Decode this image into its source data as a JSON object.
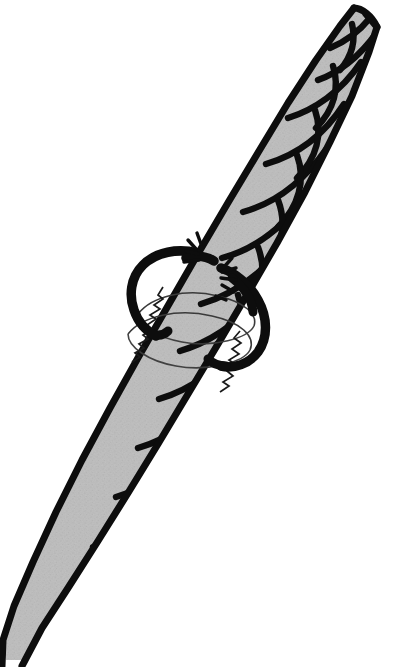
{
  "figure": {
    "title": "Twisted rope with whipping loop",
    "domain": "line-drawing",
    "canvas": {
      "width": 398,
      "height": 667
    },
    "background_color": "#ffffff",
    "ink_color": "#0d0d0d",
    "strand_fill_color": "#b3b3b3",
    "strand_fill_color_dark": "#a2a2a2",
    "thin_line_color": "#4a4a4a",
    "subject": "rope",
    "elements": [
      {
        "name": "rope-body",
        "label": "Twisted rope",
        "interactable": false
      },
      {
        "name": "rope-strand-divider",
        "label": "Strand seam lines",
        "interactable": false
      },
      {
        "name": "whipping-loop-upper-left",
        "label": "Upper-left heavy loop",
        "interactable": false
      },
      {
        "name": "whipping-loop-lower-right",
        "label": "Lower-right heavy loop",
        "interactable": false
      },
      {
        "name": "torn-band-ellipse",
        "label": "Thin elliptical band",
        "interactable": false
      },
      {
        "name": "zigzag-edge-left",
        "label": "Left zig-zag torn edge",
        "interactable": false
      },
      {
        "name": "zigzag-edge-right",
        "label": "Right zig-zag torn edge",
        "interactable": false
      },
      {
        "name": "whisker-hairs",
        "label": "Loose fibre whiskers",
        "interactable": false
      }
    ],
    "geometry": {
      "rope_axis": {
        "x1": 30,
        "y1": 650,
        "x2": 366,
        "y2": 14
      },
      "rope_width_px": 58,
      "rope_tip_top": {
        "x": 366,
        "y": 14
      },
      "rope_tip_bottom": {
        "x": 24,
        "y": 660
      },
      "knot_center": {
        "x": 196,
        "y": 318
      },
      "twist_period_px": 120
    }
  }
}
